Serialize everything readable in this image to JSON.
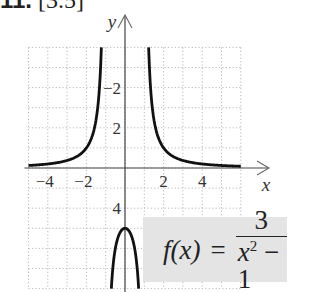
{
  "header": {
    "number": "11.",
    "section": "[3.5]"
  },
  "formula": {
    "lhs": "f(x)",
    "eq": "=",
    "numerator": "3",
    "denominator_var": "x",
    "denominator_exp": "2",
    "denominator_rest": " − 1"
  },
  "chart_data": {
    "type": "line",
    "title": "",
    "function": "f(x) = 3/(x^2 - 1)",
    "xlabel": "x",
    "ylabel": "y",
    "xlim": [
      -5,
      6
    ],
    "ylim": [
      -6,
      6
    ],
    "grid": true,
    "x_ticks": [
      -4,
      -2,
      2,
      4
    ],
    "y_ticks": [
      -2,
      2,
      4
    ],
    "vertical_asymptotes": [
      -1,
      1
    ],
    "horizontal_asymptote": 0,
    "series": [
      {
        "name": "left branch",
        "x": [
          -5,
          -4,
          -3,
          -2,
          -1.5,
          -1.22
        ],
        "y": [
          0.125,
          0.2,
          0.375,
          1,
          2.4,
          6
        ]
      },
      {
        "name": "middle branch",
        "x": [
          -0.707,
          -0.5,
          0,
          0.5,
          0.707
        ],
        "y": [
          -6,
          -4,
          -3,
          -4,
          -6
        ]
      },
      {
        "name": "right branch",
        "x": [
          1.22,
          1.5,
          2,
          3,
          4,
          5,
          6
        ],
        "y": [
          6,
          2.4,
          1,
          0.375,
          0.2,
          0.125,
          0.086
        ]
      }
    ],
    "tick_labels": {
      "x": [
        "−4",
        "−2",
        "2",
        "4"
      ],
      "y": [
        "4",
        "2",
        "−2"
      ]
    }
  }
}
